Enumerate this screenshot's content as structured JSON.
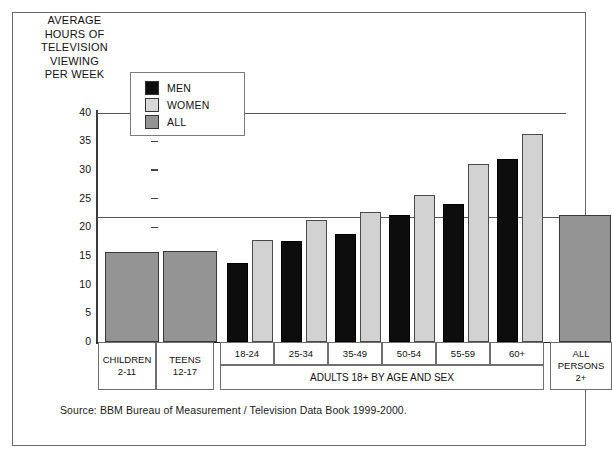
{
  "figure": {
    "axis_title": "AVERAGE\nHOURS OF\nTELEVISION\nVIEWING\nPER WEEK",
    "source_note": "Source: BBM Bureau of Measurement / Television Data Book 1999-2000."
  },
  "legend": {
    "items": [
      {
        "label": "MEN",
        "color": "#0d0d0d",
        "icon": "legend-swatch-men"
      },
      {
        "label": "WOMEN",
        "color": "#d8d8d8",
        "icon": "legend-swatch-women"
      },
      {
        "label": "ALL",
        "color": "#949494",
        "icon": "legend-swatch-all"
      }
    ]
  },
  "axis": {
    "y_ticks": [
      "40",
      "35",
      "30",
      "25",
      "20",
      "15",
      "10",
      "5",
      "0"
    ]
  },
  "categories": {
    "children": {
      "line1": "CHILDREN",
      "line2": "2-11"
    },
    "teens": {
      "line1": "TEENS",
      "line2": "12-17"
    },
    "adults_band": "ADULTS 18+ BY AGE AND SEX",
    "all_persons": {
      "line1": "ALL",
      "line2": "PERSONS",
      "line3": "2+"
    },
    "age_groups": [
      "18-24",
      "25-34",
      "35-49",
      "50-54",
      "55-59",
      "60+"
    ]
  },
  "chart_data": {
    "type": "bar",
    "title": "AVERAGE HOURS OF TELEVISION VIEWING PER WEEK",
    "xlabel": "ADULTS 18+ BY AGE AND SEX",
    "ylabel": "AVERAGE HOURS OF TELEVISION VIEWING PER WEEK",
    "ylim": [
      0,
      40
    ],
    "ytick_step": 5,
    "grid": false,
    "legend_position": "top-left-inside",
    "categories": [
      "CHILDREN 2-11",
      "TEENS 12-17",
      "18-24",
      "25-34",
      "35-49",
      "50-54",
      "55-59",
      "60+",
      "ALL PERSONS 2+"
    ],
    "series": [
      {
        "name": "MEN",
        "color": "#0d0d0d",
        "values": [
          null,
          null,
          13.8,
          17.7,
          18.9,
          22.1,
          24.1,
          31.9,
          null
        ]
      },
      {
        "name": "WOMEN",
        "color": "#d8d8d8",
        "values": [
          null,
          null,
          17.8,
          21.3,
          22.6,
          25.6,
          31.0,
          36.2,
          null
        ]
      },
      {
        "name": "ALL",
        "color": "#949494",
        "values": [
          15.7,
          15.8,
          null,
          null,
          null,
          null,
          null,
          null,
          22.2
        ]
      }
    ],
    "reference_line": {
      "value": 21.8,
      "label": "average all persons 2+"
    },
    "annotations": [
      "Source: BBM Bureau of Measurement / Television Data Book 1999-2000."
    ]
  }
}
